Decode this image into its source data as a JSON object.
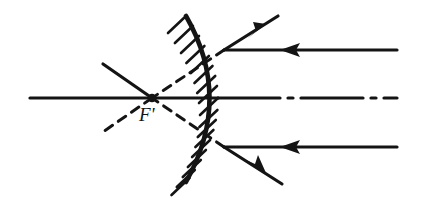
{
  "figure": {
    "kind": "optics-ray-diagram",
    "background_color": "#ffffff",
    "ink_color": "#141414",
    "width": 424,
    "height": 197
  },
  "labels": {
    "focal_point": "F'"
  },
  "mirror": {
    "name": "convex-mirror",
    "type": "convex",
    "vertex": [
      218,
      98
    ],
    "top_end": [
      186,
      16
    ],
    "bottom_end": [
      186,
      182
    ],
    "bulge_direction": "right",
    "hatching_side": "left",
    "hatch_count": 17,
    "hatch_length": 26,
    "hatch_angle_deg": -52
  },
  "optical_axis": {
    "name": "optical-axis",
    "style": "dash-dot",
    "x_start": 30,
    "x_end": 397,
    "y": 98
  },
  "incident_rays": [
    {
      "name": "incident-ray-upper",
      "from": [
        397,
        50
      ],
      "to": [
        224,
        50
      ],
      "direction": "leftward",
      "arrow_at": [
        292,
        50
      ],
      "style": "solid"
    },
    {
      "name": "incident-ray-axial",
      "from": [
        397,
        98
      ],
      "to": [
        218,
        98
      ],
      "direction": "leftward",
      "arrow_at": null,
      "style": "dash-dot"
    },
    {
      "name": "incident-ray-lower",
      "from": [
        397,
        147
      ],
      "to": [
        224,
        147
      ],
      "direction": "leftward",
      "arrow_at": [
        292,
        147
      ],
      "style": "solid"
    }
  ],
  "reflected_rays": [
    {
      "name": "reflected-ray-upper",
      "from": [
        224,
        50
      ],
      "to": [
        278,
        16
      ],
      "direction": "up-right",
      "arrow_at": [
        262,
        26
      ],
      "style": "solid"
    },
    {
      "name": "reflected-ray-lower",
      "from": [
        224,
        147
      ],
      "to": [
        282,
        184
      ],
      "direction": "down-right",
      "arrow_at": [
        262,
        172
      ],
      "style": "solid"
    }
  ],
  "virtual_rays": [
    {
      "name": "virtual-ray-upper",
      "from": [
        224,
        50
      ],
      "to": [
        152,
        98
      ],
      "style": "dashed",
      "meaning": "back-extension of upper reflected ray"
    },
    {
      "name": "virtual-ray-lower",
      "from": [
        224,
        147
      ],
      "to": [
        152,
        98
      ],
      "style": "dashed",
      "meaning": "back-extension of lower reflected ray"
    },
    {
      "name": "virtual-ray-upper-beyond-focus",
      "from": [
        152,
        98
      ],
      "to": [
        103,
        64
      ],
      "style": "solid",
      "meaning": "continuation past focal point, upper-left"
    },
    {
      "name": "virtual-ray-lower-beyond-focus",
      "from": [
        152,
        98
      ],
      "to": [
        100,
        134
      ],
      "style": "dashed",
      "meaning": "continuation past focal point, lower-left"
    }
  ],
  "focal_point": {
    "name": "virtual-focal-point",
    "position": [
      152,
      98
    ],
    "label": "F'",
    "label_position": [
      139,
      104
    ]
  }
}
